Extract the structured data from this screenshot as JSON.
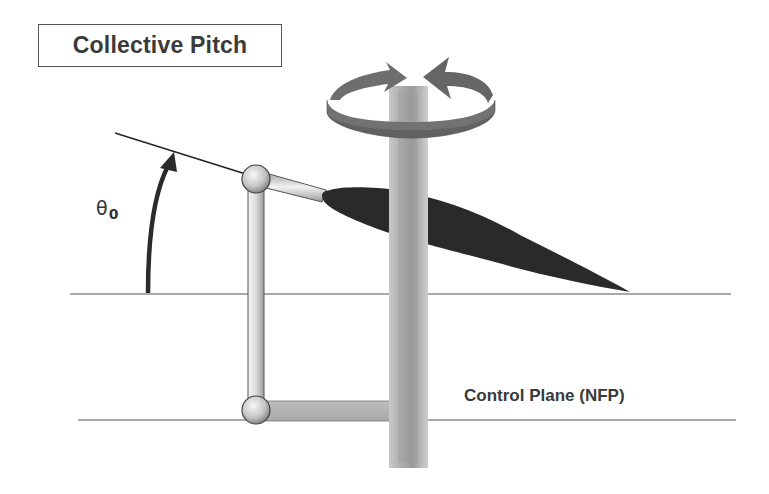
{
  "diagram": {
    "title": "Collective Pitch",
    "angle_label": {
      "symbol": "θ",
      "subscript": "0"
    },
    "control_plane_label": "Control Plane (NFP)",
    "components": [
      "rotor-shaft",
      "rotation-direction-ring",
      "blade-airfoil",
      "pitch-horn",
      "pitch-link-rod",
      "control-arm",
      "upper-ball-joint",
      "lower-ball-joint",
      "blade-chord-reference-line",
      "horizontal-reference-plane",
      "control-plane-line",
      "pitch-angle-arrow"
    ],
    "colors": {
      "airfoil": "#2a2a2a",
      "ring": "#6b6b6b",
      "shaft": "#b9b9b9",
      "lines": "#444444",
      "text": "#3a3a3a"
    }
  }
}
